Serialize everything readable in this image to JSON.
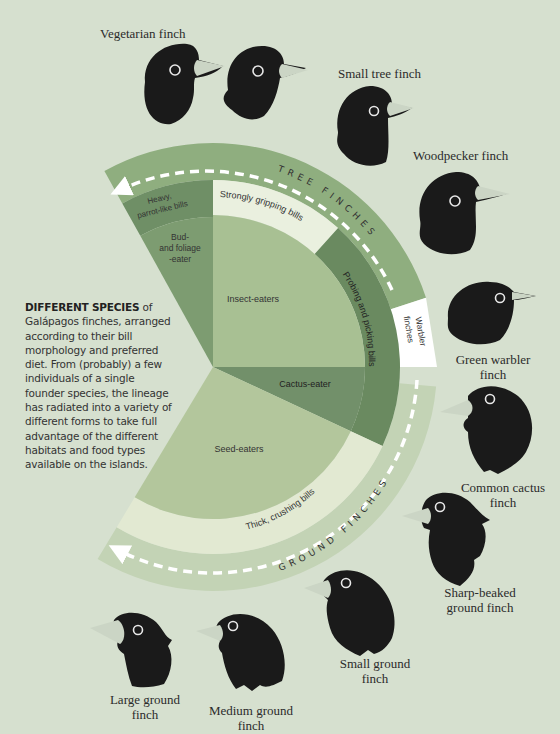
{
  "intro": {
    "heading": "DIFFERENT SPECIES",
    "body": "of Galápagos finches, arranged according to their bill morphology and preferred diet. From (probably) a few individuals of a single founder species, the lineage has radiated into a variety of different forms to take full advantage of the different habitats and food types available on the islands."
  },
  "diagram": {
    "center": [
      213,
      367
    ],
    "groups": {
      "tree": "TREE FINCHES",
      "ground": "GROUND FINCHES",
      "warbler": "Warbler finches"
    },
    "bill_bands": {
      "heavy_parrot": "Heavy, parrot-like bills",
      "strongly_gripping": "Strongly gripping bills",
      "probing": "Probing and picking bills",
      "thick_crushing": "Thick, crushing bills"
    },
    "diets": {
      "bud_foliage": "Bud- and foliage -eater",
      "insect": "Insect-eaters",
      "cactus": "Cactus-eater",
      "seed": "Seed-eaters"
    },
    "colors": {
      "background": "#d6e0cf",
      "tree_band": "#8fae7f",
      "heavy_parrot": "#6f8f66",
      "bud_foliage": "#7d9c71",
      "strongly_gripping": "#eaf0df",
      "insect": "#a8c093",
      "probing": "#6a8a60",
      "cactus": "#72906a",
      "seed": "#b3c69c",
      "thick_crushing": "#e2e9d2",
      "ground_band": "#c3d3b5",
      "warbler": "#ffffff",
      "bird": "#1a1a1a",
      "beak": "#cbd5c5"
    }
  },
  "birds": [
    {
      "name": "Vegetarian finch"
    },
    {
      "name": "Small tree finch"
    },
    {
      "name": "Woodpecker finch"
    },
    {
      "name": "Green warbler finch"
    },
    {
      "name": "Common cactus finch"
    },
    {
      "name": "Sharp-beaked ground finch"
    },
    {
      "name": "Small ground finch"
    },
    {
      "name": "Medium ground finch"
    },
    {
      "name": "Large ground finch"
    }
  ],
  "bird_labels": {
    "vegetarian": "Vegetarian finch",
    "small_tree": "Small tree finch",
    "woodpecker": "Woodpecker finch",
    "green_warbler_1": "Green warbler",
    "green_warbler_2": "finch",
    "common_cactus_1": "Common cactus",
    "common_cactus_2": "finch",
    "sharp_beaked_1": "Sharp-beaked",
    "sharp_beaked_2": "ground finch",
    "small_ground_1": "Small ground",
    "small_ground_2": "finch",
    "medium_ground_1": "Medium ground",
    "medium_ground_2": "finch",
    "large_ground_1": "Large ground",
    "large_ground_2": "finch"
  }
}
